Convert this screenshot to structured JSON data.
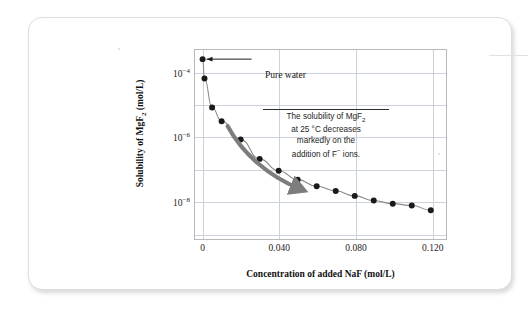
{
  "figure": {
    "pure_water_label": "Pure water",
    "callout": {
      "line1_a": "The solubility of MgF",
      "line1_sub": "2",
      "line2": "at 25 °C decreases",
      "line3": "markedly on the",
      "line4_a": "addition of F",
      "line4_sup": "−",
      "line4_b": " ions."
    }
  },
  "chart_data": {
    "type": "scatter",
    "title": "",
    "xlabel": "Concentration of added NaF (mol/L)",
    "ylabel": "Solubility of MgF2 (mol/L)",
    "xlabel_parts": {
      "pre": "Concentration of added NaF (mol/L)"
    },
    "ylabel_parts": {
      "pre": "Solubility of MgF",
      "sub": "2",
      "post": " (mol/L)"
    },
    "x_ticks": [
      "0",
      "0.040",
      "0.080",
      "0.120"
    ],
    "x_tick_values": [
      0,
      0.04,
      0.08,
      0.12
    ],
    "y_ticks": [
      "10",
      "10",
      "10"
    ],
    "y_tick_exponents": [
      "−4",
      "−6",
      "−8"
    ],
    "y_tick_values": [
      0.0001,
      1e-06,
      1e-08
    ],
    "xlim": [
      -0.004,
      0.128
    ],
    "ylim_log10": [
      -9.2,
      -3.3
    ],
    "grid": true,
    "legend": null,
    "marker_color": "#1a1a1a",
    "line_color": "#8a8a8a",
    "grid_color": "#ccd3dd",
    "frame_color": "#b9b9b9",
    "arrow_color": "#7d7d7d",
    "x": [
      0.0,
      0.001,
      0.005,
      0.01,
      0.02,
      0.03,
      0.04,
      0.05,
      0.06,
      0.07,
      0.08,
      0.09,
      0.1,
      0.11,
      0.12
    ],
    "y": [
      0.00026,
      6.5e-05,
      8e-06,
      3e-06,
      8e-07,
      2e-07,
      8.5e-08,
      4.5e-08,
      2.8e-08,
      2e-08,
      1.4e-08,
      1e-08,
      8e-09,
      7e-09,
      5e-09
    ],
    "series": [
      {
        "name": "MgF2 solubility vs added NaF",
        "points": [
          {
            "x": 0.0,
            "y": 0.00026,
            "note": "Pure water"
          },
          {
            "x": 0.001,
            "y": 6.5e-05
          },
          {
            "x": 0.005,
            "y": 8e-06
          },
          {
            "x": 0.01,
            "y": 3e-06
          },
          {
            "x": 0.02,
            "y": 8e-07
          },
          {
            "x": 0.03,
            "y": 2e-07
          },
          {
            "x": 0.04,
            "y": 8.5e-08
          },
          {
            "x": 0.05,
            "y": 4.5e-08
          },
          {
            "x": 0.06,
            "y": 2.8e-08
          },
          {
            "x": 0.07,
            "y": 2e-08
          },
          {
            "x": 0.08,
            "y": 1.4e-08
          },
          {
            "x": 0.09,
            "y": 1e-08
          },
          {
            "x": 0.1,
            "y": 8e-09
          },
          {
            "x": 0.11,
            "y": 7e-09
          },
          {
            "x": 0.12,
            "y": 5e-09
          }
        ]
      }
    ],
    "annotations": [
      {
        "name": "pure-water",
        "text": "Pure water",
        "points_to": {
          "x": 0.0,
          "y": 0.00026
        }
      },
      {
        "name": "trend-callout",
        "text": "The solubility of MgF2 at 25 °C decreases markedly on the addition of F− ions."
      }
    ]
  }
}
